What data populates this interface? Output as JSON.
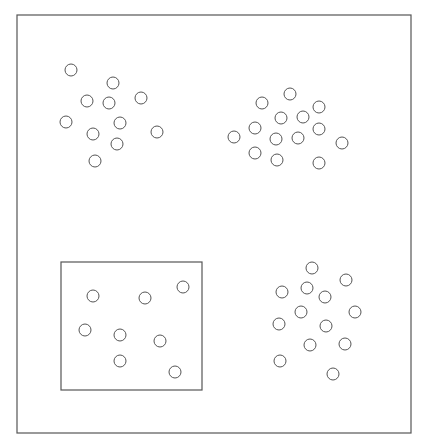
{
  "diagram": {
    "width": 426,
    "height": 444,
    "background": "#ffffff",
    "stroke_color": "#555555",
    "outer_frame": {
      "x": 17,
      "y": 15,
      "width": 394,
      "height": 418
    },
    "inner_box": {
      "x": 61,
      "y": 262,
      "width": 141,
      "height": 128
    },
    "circle_radius": 6,
    "clusters": [
      {
        "name": "top-left",
        "points": [
          [
            71,
            70
          ],
          [
            113,
            83
          ],
          [
            87,
            101
          ],
          [
            109,
            103
          ],
          [
            141,
            98
          ],
          [
            66,
            122
          ],
          [
            120,
            123
          ],
          [
            93,
            134
          ],
          [
            157,
            132
          ],
          [
            117,
            144
          ],
          [
            95,
            161
          ]
        ]
      },
      {
        "name": "top-right",
        "points": [
          [
            290,
            94
          ],
          [
            262,
            103
          ],
          [
            319,
            107
          ],
          [
            281,
            118
          ],
          [
            303,
            117
          ],
          [
            255,
            128
          ],
          [
            319,
            129
          ],
          [
            234,
            137
          ],
          [
            276,
            139
          ],
          [
            298,
            138
          ],
          [
            342,
            143
          ],
          [
            255,
            153
          ],
          [
            277,
            160
          ],
          [
            319,
            163
          ]
        ]
      },
      {
        "name": "bottom-left-boxed",
        "points": [
          [
            93,
            296
          ],
          [
            145,
            298
          ],
          [
            183,
            287
          ],
          [
            85,
            330
          ],
          [
            120,
            335
          ],
          [
            160,
            341
          ],
          [
            120,
            361
          ],
          [
            175,
            372
          ]
        ]
      },
      {
        "name": "bottom-right",
        "points": [
          [
            312,
            268
          ],
          [
            346,
            280
          ],
          [
            282,
            292
          ],
          [
            307,
            288
          ],
          [
            325,
            297
          ],
          [
            301,
            312
          ],
          [
            355,
            312
          ],
          [
            279,
            324
          ],
          [
            326,
            326
          ],
          [
            310,
            345
          ],
          [
            345,
            344
          ],
          [
            280,
            361
          ],
          [
            333,
            374
          ]
        ]
      }
    ]
  }
}
